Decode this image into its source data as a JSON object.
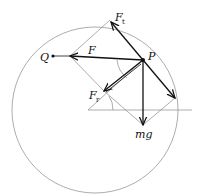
{
  "diagram": {
    "type": "force-decomposition",
    "labels": {
      "Q": "Q",
      "P": "P",
      "F": "F",
      "Ft_main": "F",
      "Ft_sub": "t",
      "Fr_main": "F",
      "Fr_sub": "r",
      "mg": "mg"
    },
    "points": {
      "P": [
        143,
        60
      ],
      "Q": [
        53,
        56
      ],
      "circle_center": [
        95,
        110
      ],
      "circle_radius": 83
    },
    "colors": {
      "force": "#111111",
      "construction": "#8a8a8a"
    }
  }
}
